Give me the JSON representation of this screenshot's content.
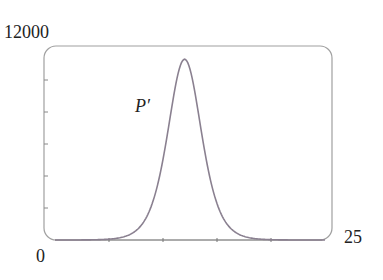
{
  "chart_data": {
    "type": "line",
    "title": "",
    "xlabel": "",
    "ylabel": "",
    "xlim": [
      0,
      25
    ],
    "ylim": [
      0,
      12000
    ],
    "x_tick_labels": [
      "0",
      "25"
    ],
    "y_tick_labels": [
      "12000"
    ],
    "x_ticks": [
      5,
      10,
      15,
      20
    ],
    "y_ticks": [
      2000,
      4000,
      6000,
      8000,
      10000
    ],
    "grid": false,
    "legend": null,
    "annotations": [
      {
        "text": "P′",
        "x": 8.5,
        "y": 8000
      }
    ],
    "series": [
      {
        "name": "P'",
        "color": "#8a8090",
        "x": [
          0,
          2,
          4,
          6,
          8,
          10,
          11,
          12,
          12.2,
          13,
          14,
          16,
          18,
          20,
          22,
          25
        ],
        "y": [
          50,
          200,
          650,
          1900,
          4700,
          9000,
          10700,
          11300,
          11300,
          10800,
          9300,
          5000,
          2000,
          650,
          200,
          30
        ]
      }
    ]
  },
  "labels": {
    "y_max": "12000",
    "x_min": "0",
    "x_max": "25",
    "curve": "P′"
  },
  "style": {
    "frame_color": "#9a9a9a",
    "curve_color": "#8a8090"
  }
}
